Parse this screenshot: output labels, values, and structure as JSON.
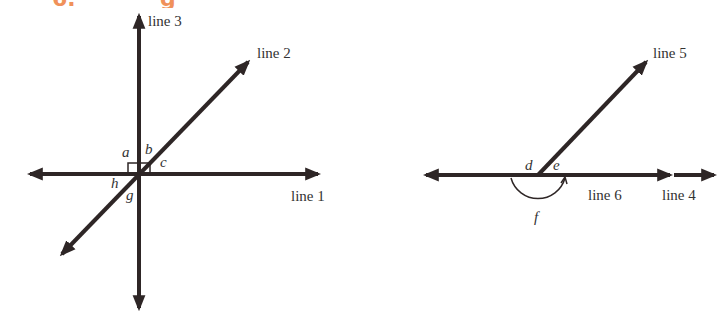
{
  "heading": {
    "fragment_left": "6.",
    "fragment_right": "g",
    "color": "#f0915a"
  },
  "diagram_left": {
    "lines": {
      "line1": "line 1",
      "line2": "line 2",
      "line3": "line 3"
    },
    "angles": [
      "a",
      "b",
      "c",
      "g",
      "h"
    ],
    "right_angle_markers": [
      "a",
      "b"
    ]
  },
  "diagram_right": {
    "lines": {
      "line4": "line 4",
      "line5": "line 5",
      "line6": "line 6"
    },
    "angles": [
      "d",
      "e",
      "f"
    ]
  },
  "colors": {
    "stroke": "#2e2626",
    "label": "#333333",
    "accent": "#f0915a"
  }
}
